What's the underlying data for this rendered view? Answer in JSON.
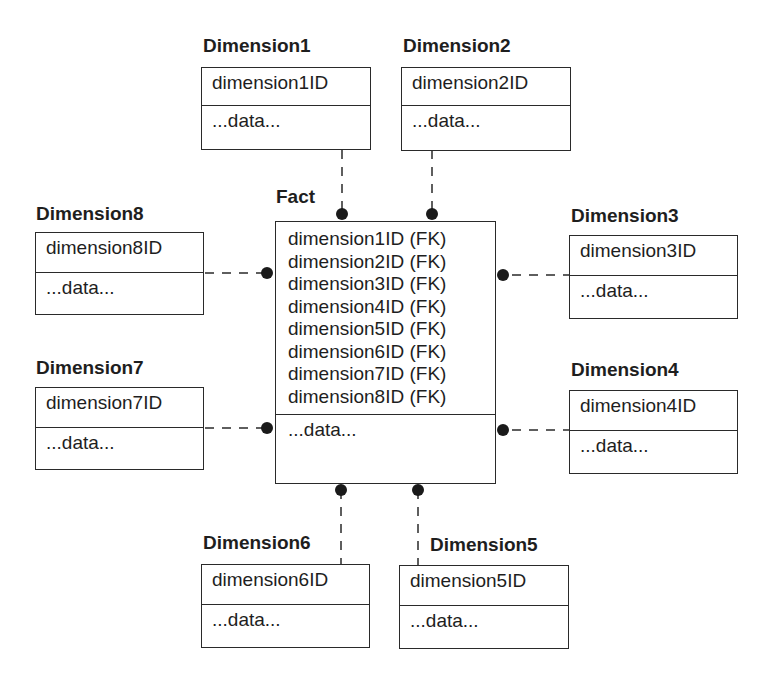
{
  "diagram": {
    "type": "star-schema",
    "fact": {
      "title": "Fact",
      "keys": [
        "dimension1ID (FK)",
        "dimension2ID (FK)",
        "dimension3ID (FK)",
        "dimension4ID (FK)",
        "dimension5ID (FK)",
        "dimension6ID (FK)",
        "dimension7ID (FK)",
        "dimension8ID (FK)"
      ],
      "attributes": "...data..."
    },
    "dimensions": [
      {
        "title": "Dimension1",
        "key": "dimension1ID",
        "attributes": "...data..."
      },
      {
        "title": "Dimension2",
        "key": "dimension2ID",
        "attributes": "...data..."
      },
      {
        "title": "Dimension3",
        "key": "dimension3ID",
        "attributes": "...data..."
      },
      {
        "title": "Dimension4",
        "key": "dimension4ID",
        "attributes": "...data..."
      },
      {
        "title": "Dimension5",
        "key": "dimension5ID",
        "attributes": "...data..."
      },
      {
        "title": "Dimension6",
        "key": "dimension6ID",
        "attributes": "...data..."
      },
      {
        "title": "Dimension7",
        "key": "dimension7ID",
        "attributes": "...data..."
      },
      {
        "title": "Dimension8",
        "key": "dimension8ID",
        "attributes": "...data..."
      }
    ],
    "relationships": [
      {
        "from": "Dimension1",
        "to": "Fact",
        "style": "dashed",
        "end": "filled-dot"
      },
      {
        "from": "Dimension2",
        "to": "Fact",
        "style": "dashed",
        "end": "filled-dot"
      },
      {
        "from": "Dimension3",
        "to": "Fact",
        "style": "dashed",
        "end": "filled-dot"
      },
      {
        "from": "Dimension4",
        "to": "Fact",
        "style": "dashed",
        "end": "filled-dot"
      },
      {
        "from": "Dimension5",
        "to": "Fact",
        "style": "dashed",
        "end": "filled-dot"
      },
      {
        "from": "Dimension6",
        "to": "Fact",
        "style": "dashed",
        "end": "filled-dot"
      },
      {
        "from": "Dimension7",
        "to": "Fact",
        "style": "dashed",
        "end": "filled-dot"
      },
      {
        "from": "Dimension8",
        "to": "Fact",
        "style": "dashed",
        "end": "filled-dot"
      }
    ]
  }
}
